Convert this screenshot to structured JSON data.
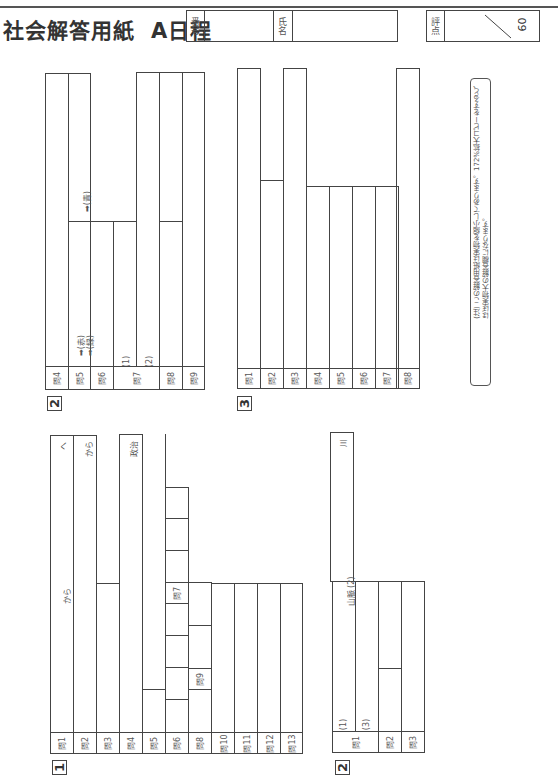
{
  "header": {
    "title": "社会解答用紙",
    "subtitle": "A日程",
    "top_strip_text": "― 問 題 ―",
    "number_label": "番号",
    "name_label": "氏名",
    "score_label": "評点",
    "score_total": "60"
  },
  "note": {
    "line1": "(注) この解答用紙は実物を縮小してあります。172%拡大コピーをすると、",
    "line2": "ほぼ実物大の解答欄になります。"
  },
  "section1": {
    "number": "1",
    "questions": [
      "問1",
      "問2",
      "問3",
      "問4",
      "問5",
      "問6",
      "問8",
      "問10",
      "問11",
      "問12",
      "問13"
    ],
    "extra_labels": {
      "q7": "問7",
      "q9": "問9"
    },
    "hints": {
      "q1_a": "から",
      "q1_b": "へ",
      "q2": "から",
      "q4": "政治"
    }
  },
  "section2a": {
    "number": "2",
    "questions": [
      "問1",
      "問2",
      "問3"
    ],
    "sub_labels": {
      "s1": "(1)",
      "s2": "(2)",
      "s3": "(3)"
    },
    "hints": {
      "q1_mountain": "山脈",
      "q1_river": "川"
    }
  },
  "section2b": {
    "number": "2",
    "questions": [
      "問4",
      "問5",
      "問6",
      "問7",
      "問8",
      "問9"
    ],
    "sub_labels": {
      "s1": "(1)",
      "s2": "(2)"
    },
    "arrows": {
      "red": "(赤)",
      "green": "(緑)",
      "blue": "(青)"
    }
  },
  "section3": {
    "number": "3",
    "questions": [
      "問1",
      "問2",
      "問3",
      "問4",
      "問5",
      "問6",
      "問7",
      "問8"
    ]
  }
}
